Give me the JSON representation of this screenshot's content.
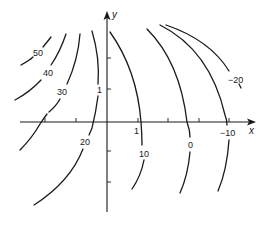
{
  "diagram": {
    "type": "contour-plot",
    "axes": {
      "x_label": "x",
      "y_label": "y",
      "x_tick_label": "1",
      "y_tick_label": "1"
    },
    "contours": [
      {
        "level": "50",
        "label": "50"
      },
      {
        "level": "40",
        "label": "40"
      },
      {
        "level": "30",
        "label": "30"
      },
      {
        "level": "20",
        "label": "20"
      },
      {
        "level": "10",
        "label": "10"
      },
      {
        "level": "0",
        "label": "0"
      },
      {
        "level": "-10",
        "label": "−10"
      },
      {
        "level": "-20",
        "label": "−20"
      }
    ],
    "colors": {
      "ink": "#1a1a1a",
      "background": "#ffffff"
    }
  }
}
